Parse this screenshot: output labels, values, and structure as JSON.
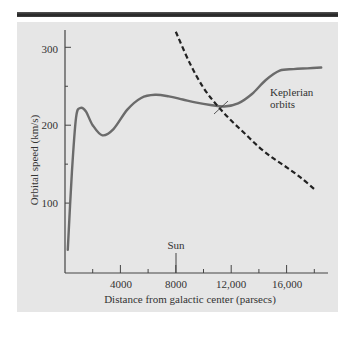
{
  "chart_data": {
    "type": "line",
    "title": "",
    "xlabel": "Distance from galactic center (parsecs)",
    "ylabel": "Orbital speed (km/s)",
    "xlim": [
      0,
      19000
    ],
    "ylim": [
      10,
      320
    ],
    "xticks": [
      2000,
      4000,
      6000,
      8000,
      10000,
      12000,
      14000,
      16000,
      18000
    ],
    "xtick_labels": [
      "4000",
      "8000",
      "12,000",
      "16,000"
    ],
    "xtick_label_values": [
      4000,
      8000,
      12000,
      16000
    ],
    "yticks": [
      100,
      150,
      200,
      250,
      300
    ],
    "ytick_labels": [
      "100",
      "200",
      "300"
    ],
    "ytick_label_values": [
      100,
      200,
      300
    ],
    "series": [
      {
        "name": "Observed rotation curve",
        "style": "solid",
        "x": [
          200,
          500,
          800,
          1100,
          1500,
          2000,
          2700,
          3500,
          4500,
          5500,
          6500,
          7500,
          8500,
          9500,
          10500,
          11500,
          12500,
          13500,
          14500,
          15500,
          16500,
          17500,
          18500
        ],
        "y": [
          40,
          140,
          210,
          222,
          218,
          200,
          187,
          195,
          220,
          235,
          239,
          237,
          233,
          229,
          226,
          224,
          228,
          240,
          258,
          270,
          272,
          273,
          274
        ]
      },
      {
        "name": "Keplerian orbits",
        "style": "dashed",
        "x": [
          8000,
          9000,
          10000,
          11000,
          12000,
          13000,
          14000,
          15000,
          16000,
          17000,
          18000
        ],
        "y": [
          320,
          280,
          248,
          225,
          206,
          189,
          172,
          158,
          146,
          133,
          118
        ]
      }
    ],
    "annotations": [
      {
        "text": "Sun",
        "x": 8000
      },
      {
        "text": "Keplerian orbits",
        "x": 13500,
        "y": 205
      }
    ],
    "grid": false,
    "legend": "none"
  },
  "labels": {
    "xlabel": "Distance from galactic center (parsecs)",
    "ylabel": "Orbital speed (km/s)",
    "sun": "Sun",
    "kepler1": "Keplerian",
    "kepler2": "orbits",
    "x4000": "4000",
    "x8000": "8000",
    "x12000": "12,000",
    "x16000": "16,000",
    "y100": "100",
    "y200": "200",
    "y300": "300"
  }
}
